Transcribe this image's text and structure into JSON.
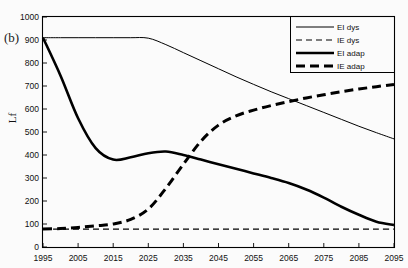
{
  "panel": {
    "label": "(b)"
  },
  "axes": {
    "ylabel": "Lf",
    "xlabel": "",
    "yticks": [
      "0",
      "100",
      "200",
      "300",
      "400",
      "500",
      "600",
      "700",
      "800",
      "900",
      "1000"
    ],
    "xticks": [
      "1995",
      "2005",
      "2015",
      "2025",
      "2035",
      "2045",
      "2055",
      "2065",
      "2075",
      "2085",
      "2095"
    ]
  },
  "legend": {
    "items": [
      {
        "label": "EI dys",
        "style": "thin-solid"
      },
      {
        "label": "IE dys",
        "style": "thin-dashed"
      },
      {
        "label": "EI adap",
        "style": "thick-solid"
      },
      {
        "label": "IE adap",
        "style": "thick-dashed"
      }
    ]
  },
  "colors": {
    "line": "#000000",
    "frame": "#000000",
    "background": "#fbfbfb"
  },
  "chart_data": {
    "type": "line",
    "title": "",
    "subtitle": "",
    "xlabel": "",
    "ylabel": "Lf",
    "xlim": [
      1995,
      2095
    ],
    "ylim": [
      0,
      1000
    ],
    "grid": false,
    "legend_position": "top-right",
    "annotations": [
      "(b)"
    ],
    "x": [
      1995,
      2000,
      2005,
      2010,
      2015,
      2020,
      2025,
      2030,
      2035,
      2040,
      2045,
      2050,
      2055,
      2060,
      2065,
      2070,
      2075,
      2080,
      2085,
      2090,
      2095
    ],
    "series": [
      {
        "name": "EI dys",
        "style": "thin-solid",
        "values": [
          910,
          910,
          910,
          910,
          910,
          910,
          908,
          880,
          845,
          810,
          775,
          740,
          707,
          675,
          645,
          615,
          585,
          555,
          525,
          497,
          470
        ]
      },
      {
        "name": "IE dys",
        "style": "thin-dashed",
        "values": [
          78,
          78,
          78,
          78,
          78,
          78,
          78,
          78,
          78,
          78,
          78,
          78,
          78,
          78,
          78,
          78,
          78,
          78,
          78,
          78,
          78
        ]
      },
      {
        "name": "EI adap",
        "style": "thick-solid",
        "values": [
          910,
          745,
          560,
          430,
          380,
          390,
          408,
          415,
          400,
          380,
          360,
          340,
          320,
          300,
          278,
          250,
          215,
          175,
          140,
          110,
          95
        ]
      },
      {
        "name": "IE adap",
        "style": "thick-dashed",
        "values": [
          78,
          80,
          85,
          92,
          100,
          120,
          165,
          255,
          360,
          460,
          530,
          570,
          595,
          615,
          632,
          648,
          662,
          675,
          687,
          697,
          707
        ]
      }
    ]
  }
}
